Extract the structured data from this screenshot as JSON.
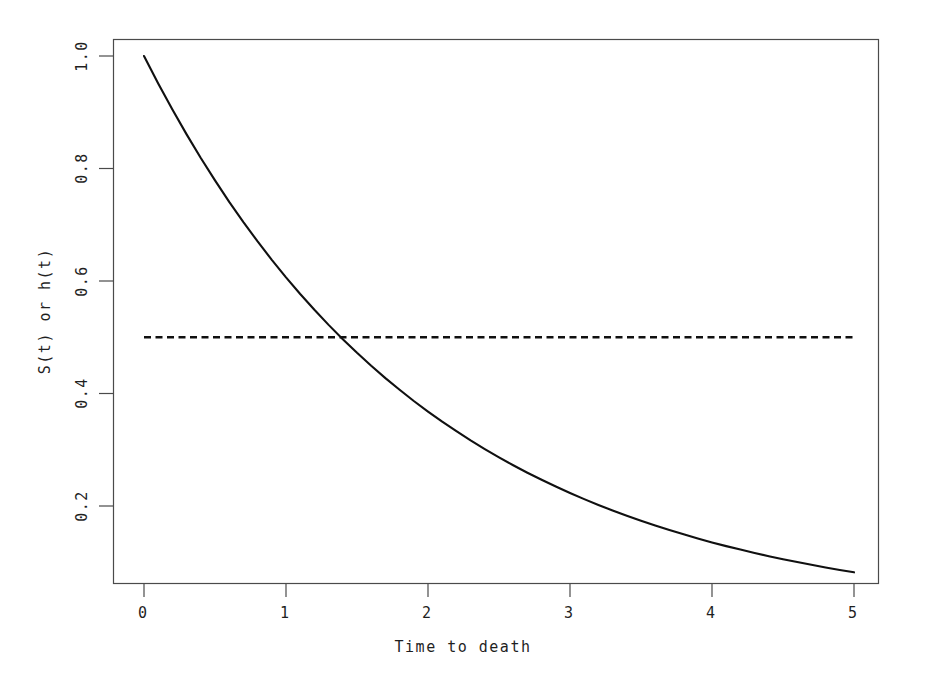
{
  "figure": {
    "width": 926,
    "height": 689,
    "background": "#ffffff",
    "foreground": "#1a1a1a"
  },
  "chart_data": {
    "type": "line",
    "title": "",
    "subtitle": "",
    "xlabel": "Time to death",
    "ylabel": "S(t) or h(t)",
    "xlim": [
      0,
      5
    ],
    "ylim": [
      0.0821,
      1.0
    ],
    "grid": false,
    "legend": "none",
    "xticks": [
      0,
      1,
      2,
      3,
      4,
      5
    ],
    "xticklabels": [
      "0",
      "1",
      "2",
      "3",
      "4",
      "5"
    ],
    "yticks": [
      0.2,
      0.4,
      0.6,
      0.8,
      1.0
    ],
    "yticklabels": [
      "0.2",
      "0.4",
      "0.6",
      "0.8",
      "1.0"
    ],
    "series": [
      {
        "name": "S(t) = exp(-0.5 t)",
        "style": "solid",
        "color": "#000000",
        "linewidth": 2.0,
        "x": [
          0,
          0.1,
          0.2,
          0.3,
          0.4,
          0.5,
          0.6,
          0.7,
          0.8,
          0.9,
          1.0,
          1.1,
          1.2,
          1.3,
          1.4,
          1.5,
          1.6,
          1.7,
          1.8,
          1.9,
          2.0,
          2.1,
          2.2,
          2.3,
          2.4,
          2.5,
          2.6,
          2.7,
          2.8,
          2.9,
          3.0,
          3.1,
          3.2,
          3.3,
          3.4,
          3.5,
          3.6,
          3.7,
          3.8,
          3.9,
          4.0,
          4.1,
          4.2,
          4.3,
          4.4,
          4.5,
          4.6,
          4.7,
          4.8,
          4.9,
          5.0
        ],
        "values": [
          1.0,
          0.9512,
          0.9048,
          0.8607,
          0.8187,
          0.7788,
          0.7408,
          0.7047,
          0.6703,
          0.6376,
          0.6065,
          0.5769,
          0.5488,
          0.522,
          0.4966,
          0.4724,
          0.4493,
          0.4274,
          0.4066,
          0.3867,
          0.3679,
          0.3499,
          0.3329,
          0.3166,
          0.3012,
          0.2865,
          0.2725,
          0.2592,
          0.2466,
          0.2346,
          0.2231,
          0.2122,
          0.2019,
          0.192,
          0.1827,
          0.1738,
          0.1653,
          0.1572,
          0.1496,
          0.1423,
          0.1353,
          0.1287,
          0.1225,
          0.1165,
          0.1108,
          0.1054,
          0.1003,
          0.0954,
          0.0907,
          0.0863,
          0.0821
        ]
      },
      {
        "name": "h(t) = 0.5",
        "style": "dashed",
        "color": "#000000",
        "linewidth": 2.2,
        "x": [
          0,
          5
        ],
        "values": [
          0.5,
          0.5
        ]
      }
    ],
    "annotations": [
      {
        "text": "",
        "note": "solid curve crosses dashed constant hazard at t = 1.386 (median survival)"
      }
    ]
  },
  "geometry": {
    "plot_left": 113,
    "plot_right": 878,
    "plot_top": 39,
    "plot_bottom": 583,
    "x0_px": 144,
    "px_per_x_unit": 142,
    "y1_px": 56,
    "px_per_02_y": 112.5
  },
  "axes": {
    "x_axis_name": "x-axis",
    "y_axis_name": "y-axis"
  }
}
